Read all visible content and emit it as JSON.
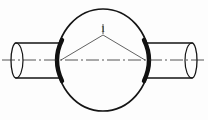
{
  "figure": {
    "type": "engineering-line-drawing",
    "background_color": "#fdfdfd",
    "line_color": "#151515",
    "width": 208,
    "height": 120
  },
  "callouts": [
    {
      "id": "callout-1",
      "label": "1",
      "label_x": 103,
      "label_y": 32,
      "apex_x": 103,
      "apex_y": 35,
      "tick_top_y": 24
    }
  ],
  "sphere": {
    "name": "spherical-body",
    "center_x": 103,
    "center_y": 60,
    "radius_x": 46,
    "radius_y": 51,
    "stroke_width": 1.6
  },
  "centerline": {
    "name": "axis-centerline",
    "y": 60,
    "x_start": 2,
    "x_end": 206,
    "stroke_width": 0.8,
    "dash_pattern": "13 3 2 3"
  },
  "pipes": [
    {
      "name": "left-pipe",
      "side": "left",
      "outer_x": 14,
      "inner_x": 59,
      "top_y": 43,
      "bottom_y": 78,
      "end_ellipse_rx": 5,
      "end_ellipse_ry": 17.5
    },
    {
      "name": "right-pipe",
      "side": "right",
      "outer_x": 194,
      "inner_x": 147,
      "top_y": 43,
      "bottom_y": 78,
      "end_ellipse_rx": 5,
      "end_ellipse_ry": 17.5
    }
  ],
  "welds": [
    {
      "name": "left-weld-arc",
      "x": 59,
      "top_y": 40,
      "bottom_y": 81,
      "bulge": 7,
      "stroke_width": 4.2
    },
    {
      "name": "right-weld-arc",
      "x": 147,
      "top_y": 40,
      "bottom_y": 81,
      "bulge": -7,
      "stroke_width": 4.2
    }
  ],
  "leader_lines": [
    {
      "name": "leader-left",
      "x1": 103,
      "y1": 35,
      "x2": 61,
      "y2": 60
    },
    {
      "name": "leader-right",
      "x1": 103,
      "y1": 35,
      "x2": 145,
      "y2": 60
    }
  ]
}
